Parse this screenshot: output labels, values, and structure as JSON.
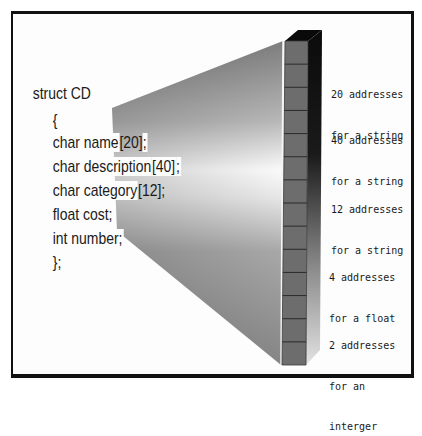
{
  "diagram": {
    "title_line": "struct CD",
    "code_lines": [
      {
        "prefix": "{",
        "highlight": ""
      },
      {
        "prefix": "char name",
        "highlight": "[20]",
        "suffix": ";"
      },
      {
        "prefix": "char description",
        "highlight": "[40]",
        "suffix": ";"
      },
      {
        "prefix": "char category",
        "highlight": "[12]",
        "suffix": ";"
      },
      {
        "prefix": "float cost;",
        "highlight": ""
      },
      {
        "prefix": "int number;",
        "highlight": ""
      },
      {
        "prefix": "};",
        "highlight": ""
      }
    ],
    "memory_cells": 14,
    "annotations": [
      {
        "line1": "20 addresses",
        "line2": "for a string"
      },
      {
        "line1": "40 addresses",
        "line2": "for a string"
      },
      {
        "line1": "12 addresses",
        "line2": "for a string"
      },
      {
        "line1": "4 addresses",
        "line2": "for a float"
      },
      {
        "line1": "2 addresses",
        "line2": "for an",
        "line3": "interger"
      }
    ],
    "colors": {
      "frame": "#111111",
      "cell_face": "#6e6e6e",
      "cell_divider": "#2a2a2a",
      "side_dark": "#111111",
      "side_light": "#dcdcdc",
      "beam_grey": "#8a8a8a",
      "beam_highlight": "#ffffff"
    }
  }
}
